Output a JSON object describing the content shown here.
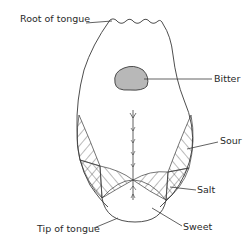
{
  "diagram": {
    "labels": {
      "root": "Root of tongue",
      "bitter": "Bitter",
      "sour": "Sour",
      "salt": "Salt",
      "sweet": "Sweet",
      "tip": "Tip of tongue"
    },
    "colors": {
      "outline": "#3a3a3a",
      "bitter_fill": "#b8b8b8",
      "background": "#ffffff"
    }
  }
}
